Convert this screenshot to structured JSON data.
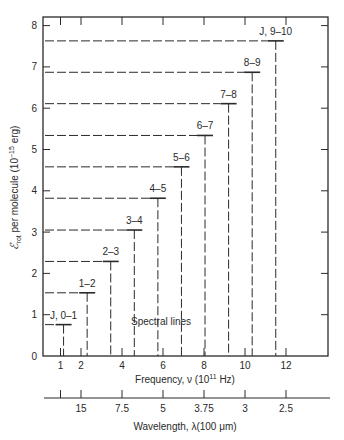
{
  "chart_data": {
    "type": "bar",
    "title": "",
    "subtitle": "",
    "xlabel": "Frequency, ν (10¹¹ Hz)",
    "xlabel_parts": {
      "text": "Frequency, ν (10",
      "sup": "11",
      "after": " Hz)"
    },
    "ylabel_parts": {
      "symbol": "ℰ",
      "sub": "rot",
      "text": " per molecule (10",
      "sup": "−15",
      "after": " erg)"
    },
    "ylabel": "ℰrot per molecule (10⁻¹⁵ erg)",
    "x2label": "Wavelength, λ(100 μm)",
    "xlim": [
      0,
      14
    ],
    "ylim": [
      0,
      8.5
    ],
    "grid": false,
    "yticks": [
      0,
      1,
      2,
      3,
      4,
      5,
      6,
      7,
      8
    ],
    "xticks": [
      1,
      2,
      4,
      6,
      8,
      10,
      12
    ],
    "x2ticks": [
      {
        "freq": 1.0,
        "label": ""
      },
      {
        "freq": 2.0,
        "label": "15"
      },
      {
        "freq": 4.0,
        "label": "7.5"
      },
      {
        "freq": 6.0,
        "label": "5"
      },
      {
        "freq": 8.0,
        "label": "3.75"
      },
      {
        "freq": 10.0,
        "label": "3"
      },
      {
        "freq": 12.0,
        "label": "2.5"
      }
    ],
    "top_ticks": [
      1,
      2,
      4,
      6,
      8,
      10,
      12
    ],
    "annotation": "Spectral lines",
    "series": [
      {
        "name": "Rotational transitions",
        "points": [
          {
            "label": "J, 0–1",
            "frequency": 1.15,
            "energy": 0.76
          },
          {
            "label": "1–2",
            "frequency": 2.3,
            "energy": 1.53
          },
          {
            "label": "2–3",
            "frequency": 3.45,
            "energy": 2.29
          },
          {
            "label": "3–4",
            "frequency": 4.6,
            "energy": 3.05
          },
          {
            "label": "4–5",
            "frequency": 5.75,
            "energy": 3.82
          },
          {
            "label": "5–6",
            "frequency": 6.9,
            "energy": 4.58
          },
          {
            "label": "6–7",
            "frequency": 8.05,
            "energy": 5.34
          },
          {
            "label": "7–8",
            "frequency": 9.2,
            "energy": 6.11
          },
          {
            "label": "8–9",
            "frequency": 10.35,
            "energy": 6.87
          },
          {
            "label": "J, 9–10",
            "frequency": 11.5,
            "energy": 7.63
          }
        ]
      }
    ]
  }
}
